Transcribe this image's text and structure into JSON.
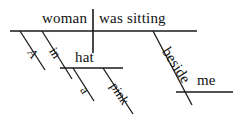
{
  "diagram": {
    "type": "reed-kellogg-sentence-diagram",
    "sentence": "A woman in a pink hat was sitting beside me.",
    "ink_color": "#1a1a1a",
    "background_color": "#ffffff",
    "labels": {
      "subject": "woman",
      "predicate": "was sitting",
      "subject_article": "A",
      "preposition_in": "in",
      "object_of_in": "hat",
      "hat_article": "a",
      "hat_adjective": "pink",
      "preposition_beside": "beside",
      "object_of_beside": "me"
    },
    "parts": [
      {
        "id": "subject",
        "text": "woman",
        "role": "subject",
        "x": 42,
        "y": 11
      },
      {
        "id": "predicate",
        "text": "was sitting",
        "role": "verb",
        "x": 99,
        "y": 11
      },
      {
        "id": "subject-article",
        "text": "A",
        "role": "article-modifier",
        "x": 25,
        "y": 40,
        "angle": 57
      },
      {
        "id": "prep-in",
        "text": "in",
        "role": "preposition",
        "x": 47,
        "y": 39,
        "angle": 57
      },
      {
        "id": "obj-hat",
        "text": "hat",
        "role": "object-of-preposition",
        "x": 75,
        "y": 50
      },
      {
        "id": "hat-article",
        "text": "a",
        "role": "article-modifier",
        "x": 78,
        "y": 78,
        "angle": 57
      },
      {
        "id": "hat-adjective",
        "text": "pink",
        "role": "adjective-modifier",
        "x": 108,
        "y": 74,
        "angle": 57
      },
      {
        "id": "prep-beside",
        "text": "beside",
        "role": "preposition",
        "x": 159,
        "y": 38,
        "angle": 57
      },
      {
        "id": "obj-me",
        "text": "me",
        "role": "object-of-preposition",
        "x": 197,
        "y": 73
      }
    ],
    "strokes": [
      {
        "id": "baseline",
        "name": "main-baseline",
        "x1": 10,
        "y1": 31,
        "x2": 197,
        "y2": 31
      },
      {
        "id": "subject-verb-divider",
        "name": "subject-verb-divider",
        "x1": 93,
        "y1": 9,
        "x2": 93,
        "y2": 53
      },
      {
        "id": "article-a-line",
        "name": "modifier-line-a",
        "x1": 20,
        "y1": 31,
        "x2": 45,
        "y2": 70
      },
      {
        "id": "prep-in-line",
        "name": "preposition-line-in",
        "x1": 42,
        "y1": 31,
        "x2": 72,
        "y2": 79
      },
      {
        "id": "hat-baseline",
        "name": "prepositional-object-line-hat",
        "x1": 60,
        "y1": 68,
        "x2": 123,
        "y2": 68
      },
      {
        "id": "hat-article-line",
        "name": "modifier-line-a-hat",
        "x1": 73,
        "y1": 68,
        "x2": 94,
        "y2": 101
      },
      {
        "id": "hat-adj-line",
        "name": "modifier-line-pink",
        "x1": 103,
        "y1": 68,
        "x2": 133,
        "y2": 114
      },
      {
        "id": "prep-beside-line",
        "name": "preposition-line-beside",
        "x1": 153,
        "y1": 31,
        "x2": 192,
        "y2": 105
      },
      {
        "id": "me-baseline",
        "name": "prepositional-object-line-me",
        "x1": 176,
        "y1": 92,
        "x2": 233,
        "y2": 92
      }
    ]
  }
}
